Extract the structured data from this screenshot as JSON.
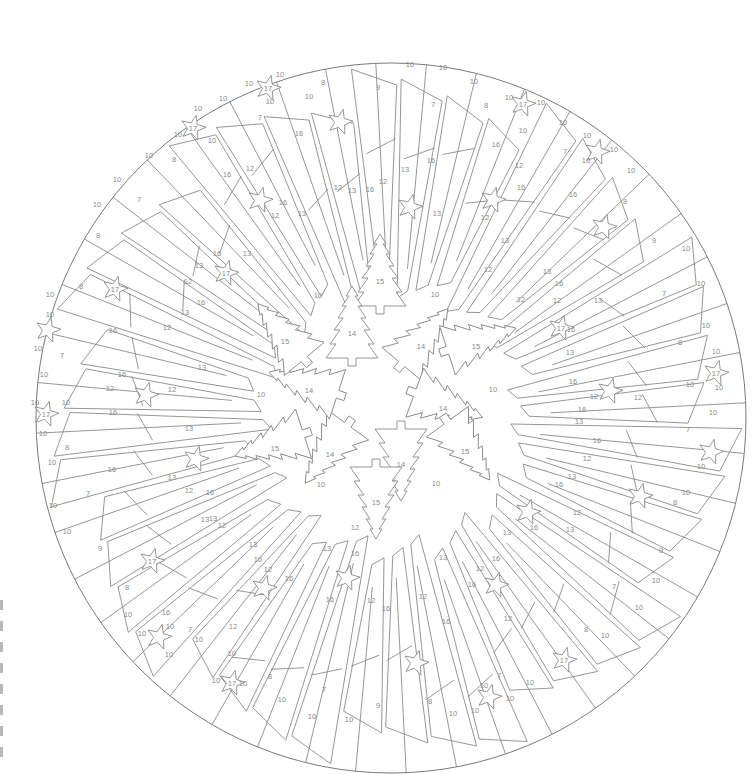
{
  "page": {
    "type": "color-by-number mandala"
  },
  "circle": {
    "cx": 391,
    "cy": 418,
    "r": 355
  },
  "colors": {
    "line": "#8a8a8a",
    "background": "#ffffff",
    "edge_mark": "#b9b9b9"
  },
  "center_ring": {
    "trees": [
      {
        "label": "15",
        "x": 380,
        "y": 276,
        "rot": 0
      },
      {
        "label": "14",
        "x": 352,
        "y": 328,
        "rot": 0
      },
      {
        "label": "14",
        "x": 421,
        "y": 341,
        "rot": 40
      },
      {
        "label": "15",
        "x": 476,
        "y": 341,
        "rot": 72
      },
      {
        "label": "14",
        "x": 443,
        "y": 403,
        "rot": 110
      },
      {
        "label": "15",
        "x": 465,
        "y": 446,
        "rot": 144
      },
      {
        "label": "14",
        "x": 401,
        "y": 459,
        "rot": 180
      },
      {
        "label": "15",
        "x": 376,
        "y": 497,
        "rot": 180
      },
      {
        "label": "14",
        "x": 330,
        "y": 449,
        "rot": 216
      },
      {
        "label": "15",
        "x": 275,
        "y": 443,
        "rot": 252
      },
      {
        "label": "14",
        "x": 309,
        "y": 385,
        "rot": 288
      },
      {
        "label": "15",
        "x": 285,
        "y": 336,
        "rot": 320
      }
    ],
    "gap_labels": [
      {
        "label": "10",
        "x": 318,
        "y": 296
      },
      {
        "label": "10",
        "x": 435,
        "y": 295
      },
      {
        "label": "10",
        "x": 493,
        "y": 390
      },
      {
        "label": "10",
        "x": 261,
        "y": 395
      },
      {
        "label": "10",
        "x": 321,
        "y": 485
      },
      {
        "label": "10",
        "x": 436,
        "y": 484
      }
    ]
  },
  "stars": [
    {
      "label": "17",
      "x": 268,
      "y": 88
    },
    {
      "label": "17",
      "x": 193,
      "y": 128
    },
    {
      "label": "",
      "x": 340,
      "y": 122
    },
    {
      "label": "17",
      "x": 523,
      "y": 104
    },
    {
      "label": "",
      "x": 597,
      "y": 152
    },
    {
      "label": "",
      "x": 260,
      "y": 200
    },
    {
      "label": "",
      "x": 410,
      "y": 207
    },
    {
      "label": "",
      "x": 493,
      "y": 200
    },
    {
      "label": "17",
      "x": 226,
      "y": 273
    },
    {
      "label": "",
      "x": 604,
      "y": 227
    },
    {
      "label": "17",
      "x": 115,
      "y": 289
    },
    {
      "label": "17",
      "x": 561,
      "y": 328
    },
    {
      "label": "",
      "x": 48,
      "y": 330
    },
    {
      "label": "",
      "x": 146,
      "y": 395
    },
    {
      "label": "",
      "x": 610,
      "y": 391
    },
    {
      "label": "17",
      "x": 716,
      "y": 373
    },
    {
      "label": "17",
      "x": 46,
      "y": 414
    },
    {
      "label": "",
      "x": 196,
      "y": 459
    },
    {
      "label": "",
      "x": 711,
      "y": 452
    },
    {
      "label": "",
      "x": 640,
      "y": 496
    },
    {
      "label": "",
      "x": 528,
      "y": 512
    },
    {
      "label": "17",
      "x": 152,
      "y": 561
    },
    {
      "label": "",
      "x": 496,
      "y": 585
    },
    {
      "label": "",
      "x": 264,
      "y": 588
    },
    {
      "label": "",
      "x": 347,
      "y": 578
    },
    {
      "label": "",
      "x": 159,
      "y": 637
    },
    {
      "label": "",
      "x": 416,
      "y": 663
    },
    {
      "label": "17",
      "x": 564,
      "y": 660
    },
    {
      "label": "17",
      "x": 232,
      "y": 683
    },
    {
      "label": "",
      "x": 489,
      "y": 697
    }
  ],
  "region_labels": [
    {
      "t": "10",
      "x": 280,
      "y": 75
    },
    {
      "t": "10",
      "x": 249,
      "y": 84
    },
    {
      "t": "10",
      "x": 270,
      "y": 102
    },
    {
      "t": "10",
      "x": 223,
      "y": 99
    },
    {
      "t": "10",
      "x": 198,
      "y": 109
    },
    {
      "t": "10",
      "x": 178,
      "y": 135
    },
    {
      "t": "10",
      "x": 212,
      "y": 141
    },
    {
      "t": "8",
      "x": 323,
      "y": 83
    },
    {
      "t": "10",
      "x": 309,
      "y": 97
    },
    {
      "t": "7",
      "x": 260,
      "y": 118
    },
    {
      "t": "16",
      "x": 299,
      "y": 134
    },
    {
      "t": "10",
      "x": 149,
      "y": 156
    },
    {
      "t": "8",
      "x": 174,
      "y": 160
    },
    {
      "t": "16",
      "x": 227,
      "y": 175
    },
    {
      "t": "12",
      "x": 250,
      "y": 169
    },
    {
      "t": "10",
      "x": 117,
      "y": 180
    },
    {
      "t": "10",
      "x": 97,
      "y": 205
    },
    {
      "t": "7",
      "x": 139,
      "y": 200
    },
    {
      "t": "16",
      "x": 283,
      "y": 203
    },
    {
      "t": "12",
      "x": 275,
      "y": 216
    },
    {
      "t": "13",
      "x": 302,
      "y": 214
    },
    {
      "t": "12",
      "x": 338,
      "y": 188
    },
    {
      "t": "13",
      "x": 352,
      "y": 191
    },
    {
      "t": "16",
      "x": 370,
      "y": 190
    },
    {
      "t": "12",
      "x": 383,
      "y": 182
    },
    {
      "t": "9",
      "x": 378,
      "y": 88
    },
    {
      "t": "10",
      "x": 410,
      "y": 65
    },
    {
      "t": "10",
      "x": 443,
      "y": 68
    },
    {
      "t": "7",
      "x": 433,
      "y": 105
    },
    {
      "t": "16",
      "x": 431,
      "y": 161
    },
    {
      "t": "13",
      "x": 405,
      "y": 170
    },
    {
      "t": "13",
      "x": 437,
      "y": 214
    },
    {
      "t": "10",
      "x": 474,
      "y": 82
    },
    {
      "t": "8",
      "x": 486,
      "y": 106
    },
    {
      "t": "16",
      "x": 496,
      "y": 145
    },
    {
      "t": "12",
      "x": 519,
      "y": 166
    },
    {
      "t": "16",
      "x": 521,
      "y": 188
    },
    {
      "t": "10",
      "x": 509,
      "y": 98
    },
    {
      "t": "10",
      "x": 541,
      "y": 103
    },
    {
      "t": "10",
      "x": 523,
      "y": 131
    },
    {
      "t": "10",
      "x": 563,
      "y": 123
    },
    {
      "t": "7",
      "x": 565,
      "y": 152
    },
    {
      "t": "10",
      "x": 587,
      "y": 136
    },
    {
      "t": "10",
      "x": 614,
      "y": 150
    },
    {
      "t": "10",
      "x": 586,
      "y": 161
    },
    {
      "t": "10",
      "x": 631,
      "y": 171
    },
    {
      "t": "16",
      "x": 573,
      "y": 195
    },
    {
      "t": "12",
      "x": 485,
      "y": 218
    },
    {
      "t": "12",
      "x": 488,
      "y": 270
    },
    {
      "t": "13",
      "x": 505,
      "y": 241
    },
    {
      "t": "13",
      "x": 547,
      "y": 272
    },
    {
      "t": "8",
      "x": 625,
      "y": 202
    },
    {
      "t": "12",
      "x": 521,
      "y": 300
    },
    {
      "t": "16",
      "x": 559,
      "y": 284
    },
    {
      "t": "12",
      "x": 557,
      "y": 301
    },
    {
      "t": "13",
      "x": 598,
      "y": 301
    },
    {
      "t": "9",
      "x": 654,
      "y": 241
    },
    {
      "t": "10",
      "x": 686,
      "y": 249
    },
    {
      "t": "7",
      "x": 664,
      "y": 294
    },
    {
      "t": "10",
      "x": 701,
      "y": 284
    },
    {
      "t": "10",
      "x": 706,
      "y": 326
    },
    {
      "t": "8",
      "x": 680,
      "y": 343
    },
    {
      "t": "16",
      "x": 571,
      "y": 330
    },
    {
      "t": "13",
      "x": 570,
      "y": 353
    },
    {
      "t": "10",
      "x": 716,
      "y": 352
    },
    {
      "t": "10",
      "x": 690,
      "y": 385
    },
    {
      "t": "10",
      "x": 719,
      "y": 388
    },
    {
      "t": "16",
      "x": 573,
      "y": 382
    },
    {
      "t": "12",
      "x": 594,
      "y": 397
    },
    {
      "t": "12",
      "x": 638,
      "y": 398
    },
    {
      "t": "16",
      "x": 582,
      "y": 410
    },
    {
      "t": "10",
      "x": 713,
      "y": 413
    },
    {
      "t": "13",
      "x": 579,
      "y": 422
    },
    {
      "t": "7",
      "x": 688,
      "y": 430
    },
    {
      "t": "16",
      "x": 597,
      "y": 441
    },
    {
      "t": "12",
      "x": 587,
      "y": 459
    },
    {
      "t": "10",
      "x": 701,
      "y": 467
    },
    {
      "t": "10",
      "x": 686,
      "y": 493
    },
    {
      "t": "13",
      "x": 572,
      "y": 477
    },
    {
      "t": "16",
      "x": 559,
      "y": 485
    },
    {
      "t": "12",
      "x": 577,
      "y": 513
    },
    {
      "t": "13",
      "x": 570,
      "y": 530
    },
    {
      "t": "8",
      "x": 675,
      "y": 503
    },
    {
      "t": "9",
      "x": 661,
      "y": 551
    },
    {
      "t": "10",
      "x": 656,
      "y": 581
    },
    {
      "t": "7",
      "x": 614,
      "y": 587
    },
    {
      "t": "10",
      "x": 639,
      "y": 608
    },
    {
      "t": "8",
      "x": 586,
      "y": 630
    },
    {
      "t": "10",
      "x": 605,
      "y": 636
    },
    {
      "t": "16",
      "x": 534,
      "y": 528
    },
    {
      "t": "13",
      "x": 507,
      "y": 533
    },
    {
      "t": "16",
      "x": 496,
      "y": 559
    },
    {
      "t": "12",
      "x": 480,
      "y": 569
    },
    {
      "t": "16",
      "x": 472,
      "y": 585
    },
    {
      "t": "12",
      "x": 508,
      "y": 619
    },
    {
      "t": "13",
      "x": 443,
      "y": 558
    },
    {
      "t": "16",
      "x": 446,
      "y": 622
    },
    {
      "t": "7",
      "x": 499,
      "y": 676
    },
    {
      "t": "10",
      "x": 484,
      "y": 686
    },
    {
      "t": "10",
      "x": 510,
      "y": 699
    },
    {
      "t": "10",
      "x": 475,
      "y": 711
    },
    {
      "t": "10",
      "x": 530,
      "y": 683
    },
    {
      "t": "8",
      "x": 430,
      "y": 702
    },
    {
      "t": "10",
      "x": 453,
      "y": 714
    },
    {
      "t": "12",
      "x": 423,
      "y": 597
    },
    {
      "t": "16",
      "x": 386,
      "y": 609
    },
    {
      "t": "12",
      "x": 371,
      "y": 601
    },
    {
      "t": "16",
      "x": 330,
      "y": 600
    },
    {
      "t": "13",
      "x": 327,
      "y": 549
    },
    {
      "t": "12",
      "x": 355,
      "y": 528
    },
    {
      "t": "16",
      "x": 355,
      "y": 554
    },
    {
      "t": "13",
      "x": 253,
      "y": 545
    },
    {
      "t": "16",
      "x": 258,
      "y": 560
    },
    {
      "t": "12",
      "x": 268,
      "y": 570
    },
    {
      "t": "16",
      "x": 289,
      "y": 579
    },
    {
      "t": "10",
      "x": 312,
      "y": 717
    },
    {
      "t": "7",
      "x": 324,
      "y": 690
    },
    {
      "t": "9",
      "x": 378,
      "y": 706
    },
    {
      "t": "10",
      "x": 349,
      "y": 720
    },
    {
      "t": "8",
      "x": 270,
      "y": 677
    },
    {
      "t": "10",
      "x": 282,
      "y": 700
    },
    {
      "t": "10",
      "x": 243,
      "y": 684
    },
    {
      "t": "10",
      "x": 216,
      "y": 681
    },
    {
      "t": "10",
      "x": 199,
      "y": 640
    },
    {
      "t": "7",
      "x": 190,
      "y": 630
    },
    {
      "t": "12",
      "x": 233,
      "y": 627
    },
    {
      "t": "10",
      "x": 232,
      "y": 654
    },
    {
      "t": "16",
      "x": 166,
      "y": 613
    },
    {
      "t": "10",
      "x": 142,
      "y": 634
    },
    {
      "t": "10",
      "x": 170,
      "y": 627
    },
    {
      "t": "10",
      "x": 169,
      "y": 655
    },
    {
      "t": "10",
      "x": 128,
      "y": 615
    },
    {
      "t": "8",
      "x": 127,
      "y": 588
    },
    {
      "t": "9",
      "x": 100,
      "y": 549
    },
    {
      "t": "10",
      "x": 67,
      "y": 532
    },
    {
      "t": "13",
      "x": 213,
      "y": 519
    },
    {
      "t": "12",
      "x": 222,
      "y": 526
    },
    {
      "t": "13",
      "x": 205,
      "y": 520
    },
    {
      "t": "16",
      "x": 210,
      "y": 493
    },
    {
      "t": "12",
      "x": 189,
      "y": 491
    },
    {
      "t": "13",
      "x": 172,
      "y": 478
    },
    {
      "t": "7",
      "x": 88,
      "y": 494
    },
    {
      "t": "10",
      "x": 53,
      "y": 506
    },
    {
      "t": "10",
      "x": 52,
      "y": 463
    },
    {
      "t": "16",
      "x": 112,
      "y": 470
    },
    {
      "t": "8",
      "x": 67,
      "y": 448
    },
    {
      "t": "13",
      "x": 189,
      "y": 429
    },
    {
      "t": "16",
      "x": 113,
      "y": 413
    },
    {
      "t": "10",
      "x": 35,
      "y": 403
    },
    {
      "t": "10",
      "x": 66,
      "y": 403
    },
    {
      "t": "10",
      "x": 43,
      "y": 434
    },
    {
      "t": "12",
      "x": 110,
      "y": 389
    },
    {
      "t": "12",
      "x": 172,
      "y": 390
    },
    {
      "t": "16",
      "x": 122,
      "y": 375
    },
    {
      "t": "10",
      "x": 44,
      "y": 375
    },
    {
      "t": "13",
      "x": 202,
      "y": 368
    },
    {
      "t": "7",
      "x": 62,
      "y": 356
    },
    {
      "t": "10",
      "x": 38,
      "y": 349
    },
    {
      "t": "16",
      "x": 113,
      "y": 331
    },
    {
      "t": "12",
      "x": 167,
      "y": 328
    },
    {
      "t": "10",
      "x": 50,
      "y": 315
    },
    {
      "t": "12",
      "x": 188,
      "y": 282
    },
    {
      "t": "16",
      "x": 201,
      "y": 303
    },
    {
      "t": "13",
      "x": 185,
      "y": 313
    },
    {
      "t": "8",
      "x": 81,
      "y": 287
    },
    {
      "t": "10",
      "x": 50,
      "y": 295
    },
    {
      "t": "13",
      "x": 199,
      "y": 266
    },
    {
      "t": "16",
      "x": 217,
      "y": 254
    },
    {
      "t": "13",
      "x": 247,
      "y": 254
    },
    {
      "t": "8",
      "x": 98,
      "y": 236
    }
  ],
  "edge_marks": {
    "count": 8
  }
}
